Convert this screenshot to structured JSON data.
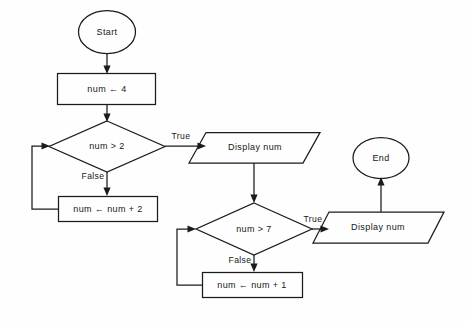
{
  "diagram": {
    "type": "flowchart",
    "background_color": "#fefefe",
    "stroke_color": "#1b1b1b",
    "text_color": "#171717",
    "nodes": [
      {
        "id": "start",
        "shape": "terminator",
        "label": "Start"
      },
      {
        "id": "init",
        "shape": "process",
        "label": "num ← 4"
      },
      {
        "id": "cond1",
        "shape": "decision",
        "label": "num > 2"
      },
      {
        "id": "incr2",
        "shape": "process",
        "label": "num ← num + 2"
      },
      {
        "id": "out1",
        "shape": "input-output",
        "label": "Display num"
      },
      {
        "id": "cond2",
        "shape": "decision",
        "label": "num > 7"
      },
      {
        "id": "incr1",
        "shape": "process",
        "label": "num ← num + 1"
      },
      {
        "id": "out2",
        "shape": "input-output",
        "label": "Display num"
      },
      {
        "id": "end",
        "shape": "terminator",
        "label": "End"
      }
    ],
    "edges": [
      {
        "from": "start",
        "to": "init",
        "label": ""
      },
      {
        "from": "init",
        "to": "cond1",
        "label": ""
      },
      {
        "from": "cond1",
        "to": "out1",
        "label": "True"
      },
      {
        "from": "cond1",
        "to": "incr2",
        "label": "False"
      },
      {
        "from": "incr2",
        "to": "cond1",
        "label": ""
      },
      {
        "from": "out1",
        "to": "cond2",
        "label": ""
      },
      {
        "from": "cond2",
        "to": "out2",
        "label": "True"
      },
      {
        "from": "cond2",
        "to": "incr1",
        "label": "False"
      },
      {
        "from": "incr1",
        "to": "cond2",
        "label": ""
      },
      {
        "from": "out2",
        "to": "end",
        "label": ""
      }
    ],
    "edge_labels": {
      "cond1_true": "True",
      "cond1_false": "False",
      "cond2_true": "True",
      "cond2_false": "False"
    }
  }
}
